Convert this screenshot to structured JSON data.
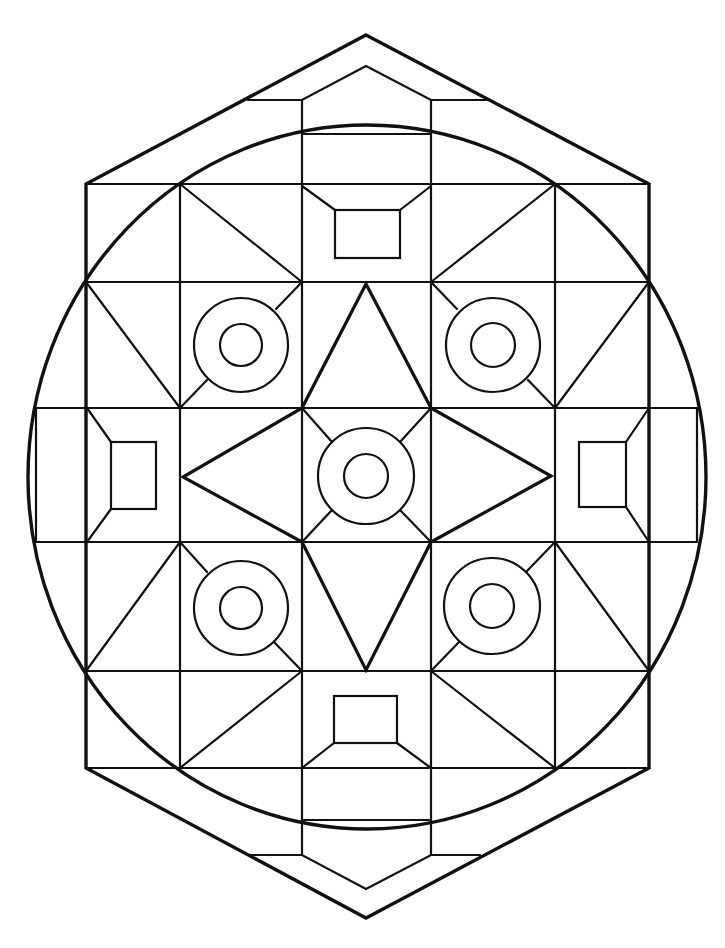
{
  "colors": {
    "line": "#111111",
    "background": "#ffffff"
  },
  "outer_hexagon": [
    [
      366,
      35
    ],
    [
      649,
      184
    ],
    [
      649,
      768
    ],
    [
      366,
      918
    ],
    [
      86,
      768
    ],
    [
      86,
      184
    ]
  ],
  "big_circle": {
    "cx": 367,
    "cy": 477,
    "rx": 339,
    "ry": 352
  },
  "top_inner_chevron": [
    [
      248,
      100
    ],
    [
      302,
      100
    ],
    [
      366,
      66
    ],
    [
      431,
      100
    ],
    [
      490,
      100
    ]
  ],
  "bottom_inner_chevron": [
    [
      250,
      855
    ],
    [
      302,
      855
    ],
    [
      366,
      889
    ],
    [
      431,
      855
    ],
    [
      480,
      855
    ]
  ],
  "star": [
    [
      366,
      284
    ],
    [
      431,
      408
    ],
    [
      551,
      476
    ],
    [
      431,
      542
    ],
    [
      366,
      670
    ],
    [
      302,
      542
    ],
    [
      183,
      477
    ],
    [
      302,
      408
    ]
  ],
  "grid_lines": [
    [
      302,
      100,
      302,
      855
    ],
    [
      431,
      100,
      431,
      855
    ],
    [
      180,
      184,
      180,
      768
    ],
    [
      555,
      184,
      555,
      768
    ],
    [
      86,
      184,
      649,
      184
    ],
    [
      86,
      282,
      649,
      282
    ],
    [
      36,
      408,
      697,
      408
    ],
    [
      36,
      542,
      697,
      542
    ],
    [
      86,
      671,
      649,
      671
    ],
    [
      86,
      768,
      649,
      768
    ],
    [
      302,
      134,
      431,
      134
    ],
    [
      302,
      820,
      431,
      820
    ],
    [
      36,
      408,
      36,
      542
    ],
    [
      697,
      408,
      697,
      542
    ]
  ],
  "diagonals": [
    [
      180,
      184,
      302,
      282
    ],
    [
      555,
      184,
      431,
      282
    ],
    [
      86,
      282,
      180,
      408
    ],
    [
      649,
      282,
      555,
      408
    ],
    [
      180,
      542,
      86,
      671
    ],
    [
      555,
      542,
      649,
      671
    ],
    [
      302,
      671,
      180,
      768
    ],
    [
      431,
      671,
      555,
      768
    ],
    [
      302,
      282,
      276,
      309
    ],
    [
      180,
      408,
      207,
      380
    ],
    [
      431,
      282,
      457,
      309
    ],
    [
      555,
      408,
      528,
      380
    ],
    [
      180,
      542,
      207,
      572
    ],
    [
      302,
      671,
      274,
      642
    ],
    [
      555,
      542,
      526,
      572
    ],
    [
      431,
      671,
      459,
      642
    ],
    [
      302,
      408,
      332,
      442
    ],
    [
      431,
      408,
      400,
      442
    ],
    [
      302,
      542,
      332,
      510
    ],
    [
      431,
      542,
      400,
      510
    ]
  ],
  "rings": [
    {
      "name": "top-left",
      "cx": 241,
      "cy": 345,
      "r_outer": 47,
      "r_inner": 21
    },
    {
      "name": "top-right",
      "cx": 493,
      "cy": 345,
      "r_outer": 47,
      "r_inner": 22
    },
    {
      "name": "center",
      "cx": 366,
      "cy": 476,
      "r_outer": 48,
      "r_inner": 22
    },
    {
      "name": "bottom-left",
      "cx": 241,
      "cy": 608,
      "r_outer": 47,
      "r_inner": 21
    },
    {
      "name": "bottom-right",
      "cx": 492,
      "cy": 606,
      "r_outer": 48,
      "r_inner": 22
    }
  ],
  "framed_rects": [
    {
      "name": "top",
      "rect": [
        335,
        210,
        400,
        258
      ],
      "legs": [
        [
          302,
          186,
          335,
          210
        ],
        [
          431,
          186,
          400,
          210
        ]
      ]
    },
    {
      "name": "bottom",
      "rect": [
        334,
        696,
        397,
        743
      ],
      "legs": [
        [
          302,
          768,
          334,
          743
        ],
        [
          431,
          768,
          397,
          743
        ]
      ]
    },
    {
      "name": "left",
      "rect": [
        111,
        442,
        156,
        509
      ],
      "legs": [
        [
          87,
          408,
          111,
          442
        ],
        [
          87,
          542,
          111,
          509
        ]
      ]
    },
    {
      "name": "right",
      "rect": [
        579,
        442,
        626,
        507
      ],
      "legs": [
        [
          649,
          408,
          626,
          442
        ],
        [
          649,
          542,
          626,
          507
        ]
      ]
    }
  ]
}
